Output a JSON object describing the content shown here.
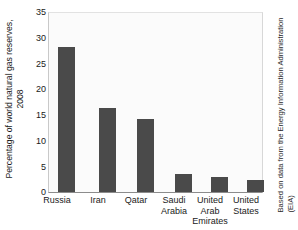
{
  "chart_data": {
    "type": "bar",
    "title": "",
    "subtitle": "",
    "xlabel": "",
    "ylabel": "Percentage of world natural gas reserves, 2008",
    "ylabel_lines": [
      "Percentage of world natural gas reserves,",
      "2008"
    ],
    "categories": [
      "Russia",
      "Iran",
      "Qatar",
      "Saudi Arabia",
      "United Arab Emirates",
      "United States"
    ],
    "category_lines": [
      [
        "Russia"
      ],
      [
        "Iran"
      ],
      [
        "Qatar"
      ],
      [
        "Saudi",
        "Arabia"
      ],
      [
        "United",
        "Arab",
        "Emirates"
      ],
      [
        "United",
        "States"
      ]
    ],
    "values": [
      28.4,
      16.4,
      14.2,
      3.6,
      2.9,
      2.3
    ],
    "ylim": [
      0,
      35
    ],
    "yticks": [
      0,
      5,
      10,
      15,
      20,
      25,
      30,
      35
    ],
    "ytick_labels": [
      "0",
      "5",
      "10",
      "15",
      "20",
      "25",
      "30",
      "35"
    ],
    "grid": false,
    "legend": false,
    "legend_position": "none",
    "bar_color": "#4a4a4a",
    "plot_background": "#fbfbfb",
    "figure_background": "#ffffff",
    "annotation": "Based on data from the Energy Information Administration (EIA)",
    "annotation_lines": [
      "Based on data from the Energy Information Administration",
      "(EIA)"
    ]
  }
}
